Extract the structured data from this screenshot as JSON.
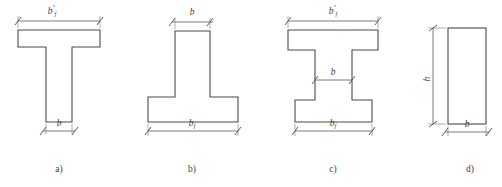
{
  "figure": {
    "background_color": "#ffffff",
    "outline_color": "#4a4a4a",
    "dimension_color": "#6e6e6e",
    "text_color": "#3d3d3d"
  },
  "sections": [
    {
      "id": "a",
      "caption": "a)",
      "shape_name": "t-section",
      "description": "T-shaped cross-section with wide top flange and narrow web",
      "dimensions": [
        {
          "name": "top-flange-width",
          "symbol": "b",
          "subscript": "f",
          "prime": "′",
          "position": "top",
          "orientation": "horizontal"
        },
        {
          "name": "web-width",
          "symbol": "b",
          "subscript": "",
          "prime": "",
          "position": "bottom",
          "orientation": "horizontal"
        }
      ]
    },
    {
      "id": "b",
      "caption": "b)",
      "shape_name": "inverted-t-section",
      "description": "Inverted T-shaped cross-section with narrow web on top and wide bottom flange",
      "dimensions": [
        {
          "name": "web-width",
          "symbol": "b",
          "subscript": "",
          "prime": "",
          "position": "top",
          "orientation": "horizontal"
        },
        {
          "name": "bottom-flange-width",
          "symbol": "b",
          "subscript": "f",
          "prime": "",
          "position": "bottom",
          "orientation": "horizontal"
        }
      ]
    },
    {
      "id": "c",
      "caption": "c)",
      "shape_name": "i-section",
      "description": "I-shaped cross-section with top flange, web and bottom flange",
      "dimensions": [
        {
          "name": "top-flange-width",
          "symbol": "b",
          "subscript": "f",
          "prime": "′",
          "position": "top",
          "orientation": "horizontal"
        },
        {
          "name": "web-width",
          "symbol": "b",
          "subscript": "",
          "prime": "",
          "position": "middle",
          "orientation": "horizontal"
        },
        {
          "name": "bottom-flange-width",
          "symbol": "b",
          "subscript": "f",
          "prime": "",
          "position": "bottom",
          "orientation": "horizontal"
        }
      ]
    },
    {
      "id": "d",
      "caption": "d)",
      "shape_name": "rectangular-section",
      "description": "Rectangular cross-section",
      "dimensions": [
        {
          "name": "section-height",
          "symbol": "h",
          "subscript": "",
          "prime": "",
          "position": "left",
          "orientation": "vertical"
        },
        {
          "name": "section-width",
          "symbol": "b",
          "subscript": "",
          "prime": "",
          "position": "bottom",
          "orientation": "horizontal"
        }
      ]
    }
  ]
}
